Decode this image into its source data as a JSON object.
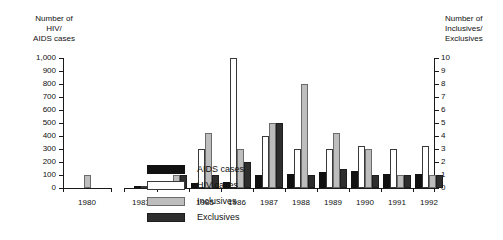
{
  "chart_data": {
    "type": "bar",
    "title": "",
    "ylabel": "Number of\nHIV/\nAIDS cases",
    "y2label": "Number of\nInclusives/\nExclusives",
    "xlabel": "",
    "categories": [
      "1980",
      "1983",
      "1984",
      "1985",
      "1986",
      "1987",
      "1988",
      "1989",
      "1990",
      "1991",
      "1992"
    ],
    "ylim": [
      0,
      1000
    ],
    "yticks": [
      "0",
      "100",
      "200",
      "300",
      "400",
      "500",
      "600",
      "700",
      "800",
      "900",
      "1,000"
    ],
    "y2lim": [
      0,
      10
    ],
    "y2ticks": [
      "0",
      "1",
      "2",
      "3",
      "4",
      "5",
      "6",
      "7",
      "8",
      "9",
      "10"
    ],
    "grid": false,
    "legend_position": "inside-upper-left",
    "axis_break": "between 1980 and 1983",
    "series": [
      {
        "name": "AIDS cases",
        "axis": "left",
        "color": "#111111",
        "values": [
          null,
          5,
          20,
          40,
          50,
          100,
          110,
          120,
          130,
          110,
          110
        ]
      },
      {
        "name": "HIV cases",
        "axis": "left",
        "color": "#ffffff",
        "values": [
          null,
          5,
          30,
          300,
          1000,
          400,
          300,
          300,
          320,
          300,
          320
        ]
      },
      {
        "name": "Inclusives",
        "axis": "right",
        "color": "#bdbdbd",
        "values": [
          1,
          null,
          1,
          4.2,
          3,
          5,
          8,
          4.2,
          3,
          1,
          1
        ]
      },
      {
        "name": "Exclusives",
        "axis": "right",
        "color": "#2e2e2e",
        "values": [
          null,
          null,
          1,
          1,
          2,
          5,
          1,
          1.5,
          1,
          1,
          1
        ]
      }
    ]
  },
  "legend": {
    "items": [
      {
        "label": "AIDS cases",
        "key": "aids"
      },
      {
        "label": "HIV cases",
        "key": "hiv"
      },
      {
        "label": "Inclusives",
        "key": "inclusive"
      },
      {
        "label": "Exclusives",
        "key": "exclusive"
      }
    ]
  }
}
